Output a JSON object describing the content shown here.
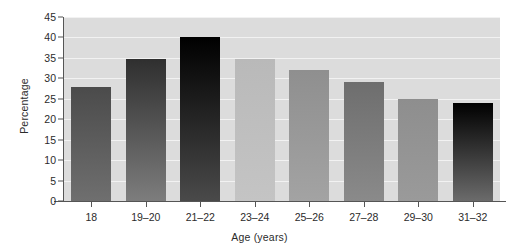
{
  "chart_data": {
    "type": "bar",
    "title": "",
    "xlabel": "Age (years)",
    "ylabel": "Percentage",
    "categories": [
      "18",
      "19–20",
      "21–22",
      "23–24",
      "25–26",
      "27–28",
      "29–30",
      "31–32"
    ],
    "values": [
      28,
      34.7,
      40,
      34.8,
      32,
      29,
      25,
      24
    ],
    "ylim": [
      0,
      45
    ],
    "yticks": [
      0,
      5,
      10,
      15,
      20,
      25,
      30,
      35,
      40,
      45
    ],
    "ytick_labels": [
      "0",
      "5",
      "10",
      "15",
      "20",
      "25",
      "30",
      "35",
      "40",
      "45"
    ],
    "grid": true,
    "legend": "none",
    "bar_colors_top": [
      "#4b4b4b",
      "#2f2f2f",
      "#000000",
      "#b9b9b9",
      "#8f8f8f",
      "#6e6e6e",
      "#8e8e8e",
      "#000000"
    ],
    "bar_colors_bottom": [
      "#6f6f6f",
      "#7d7d7d",
      "#4a4a4a",
      "#c4c4c4",
      "#a3a3a3",
      "#8a8a8a",
      "#9a9a9a",
      "#6b6b6b"
    ],
    "plot_background": "#dcdcdc",
    "grid_color": "#f2f2f2",
    "axis_color": "#555555",
    "figure_background": "#ffffff"
  }
}
